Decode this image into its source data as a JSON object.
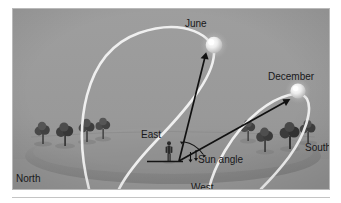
{
  "figure": {
    "colors": {
      "sky": "#9b9b9b",
      "ground": "#868686",
      "ground_far": "#a2a2a2",
      "sun_path": "#f4f4f4",
      "sun_disc": "#f2f2f2",
      "arrow": "#111111",
      "label_text": "#18181a",
      "frame_border": "#b9b9b9",
      "page_background": "#ffffff",
      "tree": "#4d4d4d",
      "observer": "#262626"
    },
    "labels": {
      "june": "June",
      "december": "December",
      "east": "East",
      "west": "West",
      "north": "North",
      "south": "South",
      "sun_angle": "Sun angle"
    },
    "elements": {
      "sun_june_name": "sun-disc-june",
      "sun_december_name": "sun-disc-december",
      "arc_june_name": "sun-path-arc-june",
      "arc_december_name": "sun-path-arc-december",
      "observer_name": "observer-figure",
      "horizon_name": "horizon-ground-ellipse",
      "angle_arc_name": "sun-angle-arc",
      "arrow_june_name": "sun-angle-arrow-june",
      "arrow_december_name": "sun-angle-arrow-december"
    }
  }
}
